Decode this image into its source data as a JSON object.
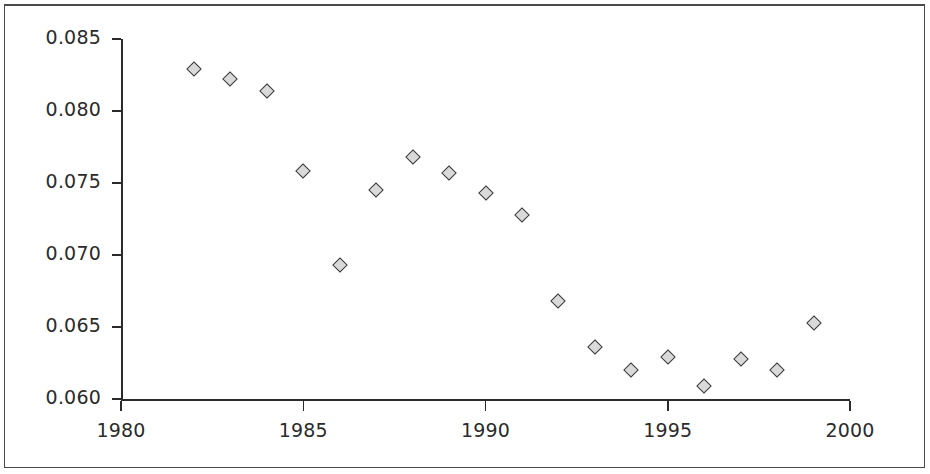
{
  "chart_data": {
    "type": "scatter",
    "title": "",
    "subtitle": "",
    "xlabel": "",
    "ylabel": "",
    "xlim": [
      1980,
      2000
    ],
    "ylim": [
      0.06,
      0.085
    ],
    "grid": false,
    "legend": null,
    "marker": {
      "shape": "diamond",
      "fill_color": "#d9d9d9",
      "edge_color": "#3a3a3a"
    },
    "axis_color": "#2b2b2b",
    "background_color": "#ffffff",
    "xticks": [
      1980,
      1985,
      1990,
      1995,
      2000
    ],
    "xtick_labels": [
      "1980",
      "1985",
      "1990",
      "1995",
      "2000"
    ],
    "yticks": [
      0.06,
      0.065,
      0.07,
      0.075,
      0.08,
      0.085
    ],
    "ytick_labels": [
      "0.060",
      "0.065",
      "0.070",
      "0.075",
      "0.080",
      "0.085"
    ],
    "x": [
      1982,
      1983,
      1984,
      1985,
      1986,
      1987,
      1988,
      1989,
      1990,
      1991,
      1992,
      1993,
      1994,
      1995,
      1996,
      1997,
      1998,
      1999
    ],
    "y": [
      0.0829,
      0.0822,
      0.0814,
      0.0758,
      0.0693,
      0.0745,
      0.0768,
      0.0757,
      0.0743,
      0.0728,
      0.0668,
      0.0636,
      0.062,
      0.0629,
      0.0609,
      0.0628,
      0.062,
      0.0653
    ],
    "points": [
      {
        "x": 1982,
        "y": 0.0829
      },
      {
        "x": 1983,
        "y": 0.0822
      },
      {
        "x": 1984,
        "y": 0.0814
      },
      {
        "x": 1985,
        "y": 0.0758
      },
      {
        "x": 1986,
        "y": 0.0693
      },
      {
        "x": 1987,
        "y": 0.0745
      },
      {
        "x": 1988,
        "y": 0.0768
      },
      {
        "x": 1989,
        "y": 0.0757
      },
      {
        "x": 1990,
        "y": 0.0743
      },
      {
        "x": 1991,
        "y": 0.0728
      },
      {
        "x": 1992,
        "y": 0.0668
      },
      {
        "x": 1993,
        "y": 0.0636
      },
      {
        "x": 1994,
        "y": 0.062
      },
      {
        "x": 1995,
        "y": 0.0629
      },
      {
        "x": 1996,
        "y": 0.0609
      },
      {
        "x": 1997,
        "y": 0.0628
      },
      {
        "x": 1998,
        "y": 0.062
      },
      {
        "x": 1999,
        "y": 0.0653
      }
    ]
  },
  "geometry": {
    "x_left_px": 121,
    "x_right_px": 850,
    "y_top_px": 39,
    "y_bottom_px": 399
  }
}
